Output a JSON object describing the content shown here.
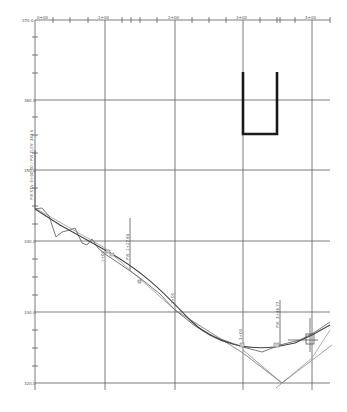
{
  "colors": {
    "grid": "#5a5a5a",
    "existing_ground": "#6b6b6b",
    "proposed": "#444444",
    "reference": "#9a9a9a",
    "structure": "#1a1a1a",
    "background": "#ffffff"
  },
  "axes": {
    "stations": [
      {
        "label": "0+00",
        "x": 35
      },
      {
        "label": "1+00",
        "x": 105
      },
      {
        "label": "2+00",
        "x": 175
      },
      {
        "label": "3+00",
        "x": 243
      },
      {
        "label": "4+00",
        "x": 312
      }
    ],
    "elevations": [
      {
        "label": "370.0",
        "y": 20
      },
      {
        "label": "360.0",
        "y": 100
      },
      {
        "label": "350.0",
        "y": 170
      },
      {
        "label": "340.0",
        "y": 241
      },
      {
        "label": "330.0",
        "y": 312
      },
      {
        "label": "320.0",
        "y": 383
      }
    ]
  },
  "annotations": {
    "begin_label": "PVI STA: 0+00.00 / PVI ELEV: 344.5",
    "pvi_1": "PVI: 1+27.65",
    "pvi_2": "PVI: 3+46.77",
    "sta_1": "1+00",
    "sta_2": "2+00",
    "sta_3": "3+00"
  }
}
